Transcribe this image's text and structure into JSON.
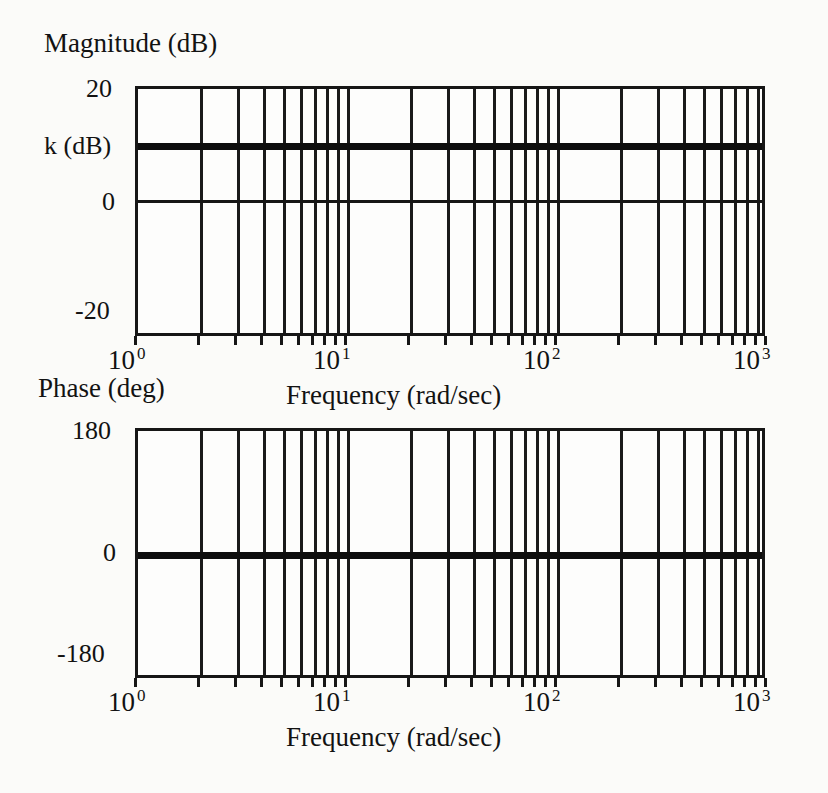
{
  "figure": {
    "kind": "bode-plot"
  },
  "magnitude_plot": {
    "title": "Magnitude  (dB)",
    "y_ticks": [
      "20",
      "k (dB)",
      "0",
      "-20"
    ],
    "x_title": "Frequency (rad/sec)",
    "x_ticks": [
      {
        "mantissa": "10",
        "exponent": "0"
      },
      {
        "mantissa": "10",
        "exponent": "1"
      },
      {
        "mantissa": "10",
        "exponent": "2"
      },
      {
        "mantissa": "10",
        "exponent": "3"
      }
    ]
  },
  "phase_plot": {
    "title": "Phase (deg)",
    "y_ticks": [
      "180",
      "0",
      "-180"
    ],
    "x_title": "Frequency (rad/sec)",
    "x_ticks": [
      {
        "mantissa": "10",
        "exponent": "0"
      },
      {
        "mantissa": "10",
        "exponent": "1"
      },
      {
        "mantissa": "10",
        "exponent": "2"
      },
      {
        "mantissa": "10",
        "exponent": "3"
      }
    ]
  },
  "colors": {
    "ink": "#161616",
    "paper": "#fbfbf9",
    "trace": "#0d0d0d"
  },
  "chart_data": [
    {
      "type": "line",
      "title": "Magnitude  (dB)",
      "xlabel": "Frequency (rad/sec)",
      "ylabel": "Magnitude (dB)",
      "xscale": "log",
      "xlim": [
        1,
        1000
      ],
      "ylim": [
        -20,
        20
      ],
      "yticks": [
        -20,
        0,
        10,
        20
      ],
      "ytick_labels": [
        "-20",
        "0",
        "k (dB)",
        "20"
      ],
      "xticks": [
        1,
        10,
        100,
        1000
      ],
      "xtick_labels": [
        "10^0",
        "10^1",
        "10^2",
        "10^3"
      ],
      "grid": true,
      "grid_style": "log-minor-vertical",
      "minor_multipliers": [
        2,
        3,
        4,
        5,
        6,
        7,
        8,
        9
      ],
      "legend": null,
      "series": [
        {
          "name": "k (constant gain)",
          "linewidth": "bold",
          "x": [
            1,
            1000
          ],
          "values": [
            10,
            10
          ]
        }
      ]
    },
    {
      "type": "line",
      "title": "Phase (deg)",
      "xlabel": "Frequency (rad/sec)",
      "ylabel": "Phase (deg)",
      "xscale": "log",
      "xlim": [
        1,
        1000
      ],
      "ylim": [
        -180,
        180
      ],
      "yticks": [
        -180,
        0,
        180
      ],
      "ytick_labels": [
        "-180",
        "0",
        "180"
      ],
      "xticks": [
        1,
        10,
        100,
        1000
      ],
      "xtick_labels": [
        "10^0",
        "10^1",
        "10^2",
        "10^3"
      ],
      "grid": true,
      "grid_style": "log-minor-vertical",
      "minor_multipliers": [
        2,
        3,
        4,
        5,
        6,
        7,
        8,
        9
      ],
      "legend": null,
      "series": [
        {
          "name": "phase of k",
          "linewidth": "bold",
          "x": [
            1,
            1000
          ],
          "values": [
            0,
            0
          ]
        }
      ]
    }
  ]
}
